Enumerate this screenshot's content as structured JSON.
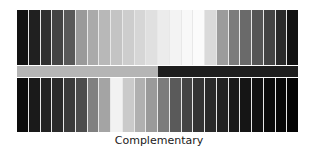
{
  "caption": "Complementary",
  "top_row": {
    "colors": [
      "#121212",
      "#202020",
      "#303030",
      "#444444",
      "#595959",
      "#9a9a9a",
      "#aaaaaa",
      "#b8b8b8",
      "#c4c4c4",
      "#cdcdcd",
      "#d6d6d6",
      "#e0e0e0",
      "#ececec",
      "#f3f3f3",
      "#f8f8f8",
      "#fbfbfb",
      "#dadada",
      "#9c9c9c",
      "#7c7c7c",
      "#6a6a6a",
      "#565656",
      "#444444",
      "#2a2a2a",
      "#121212"
    ]
  },
  "middle_band": {
    "segments": [
      {
        "color": "#b5b5b5",
        "width_pct": 50.2
      },
      {
        "color": "#1e1e1e",
        "width_pct": 49.8
      }
    ]
  },
  "bottom_row": {
    "colors": [
      "#0c0c0c",
      "#1a1a1a",
      "#222222",
      "#2a2a2a",
      "#3a3a3a",
      "#4c4c4c",
      "#808080",
      "#a4a4a4",
      "#f2f2f2",
      "#cacaca",
      "#b0b0b0",
      "#9a9a9a",
      "#7c7c7c",
      "#5a5a5a",
      "#454545",
      "#343434",
      "#2a2a2a",
      "#222222",
      "#1a1a1a",
      "#151515",
      "#111111",
      "#0b0b0b",
      "#080808",
      "#050505"
    ]
  }
}
